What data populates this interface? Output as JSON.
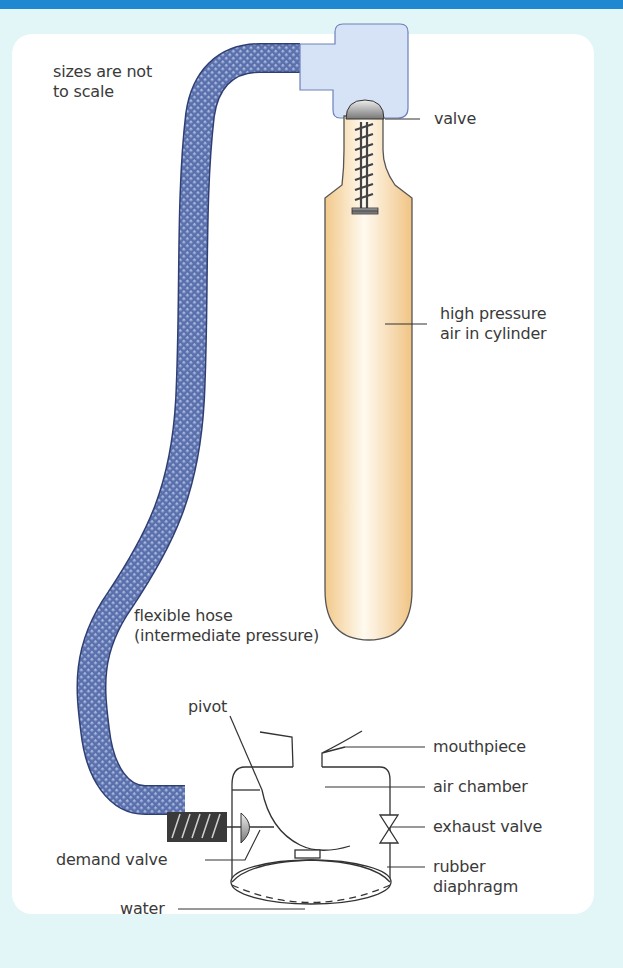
{
  "diagram": {
    "note": [
      "sizes are not",
      "to scale"
    ],
    "labels": {
      "valve": "valve",
      "cylinder": [
        "high pressure",
        "air in cylinder"
      ],
      "hose": [
        "flexible hose",
        "(intermediate pressure)"
      ],
      "pivot": "pivot",
      "mouthpiece": "mouthpiece",
      "air_chamber": "air chamber",
      "exhaust_valve": "exhaust valve",
      "diaphragm": [
        "rubber",
        "diaphragm"
      ],
      "demand_valve": "demand valve",
      "water": "water"
    },
    "colors": {
      "accent_bar": "#1f88d0",
      "background": "#e2f5f7",
      "card": "#ffffff",
      "hose": "#4a5f9e",
      "hose_fitting": "#d6e2f5",
      "cylinder": "#f5cf94",
      "line": "#333333"
    }
  }
}
